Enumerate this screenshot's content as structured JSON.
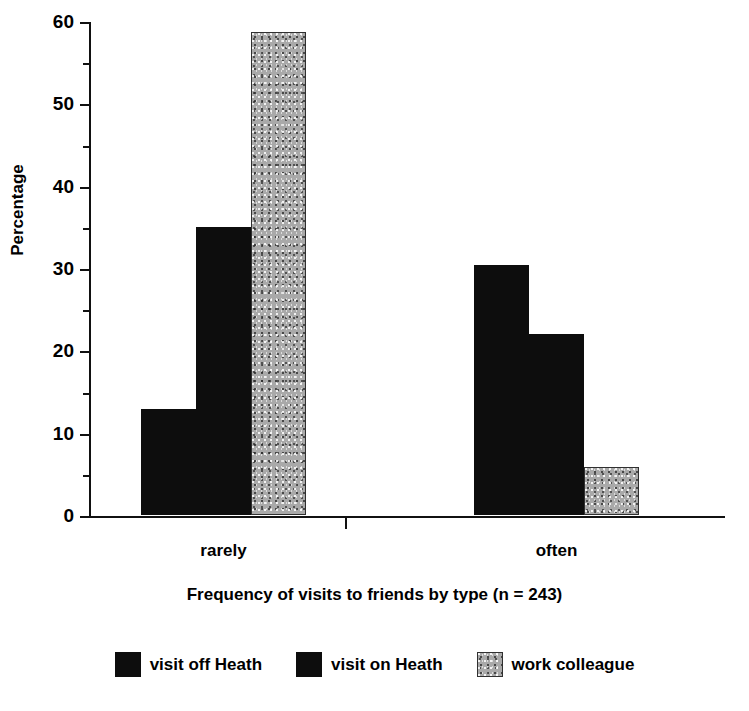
{
  "chart_data": {
    "type": "bar",
    "title": "",
    "subtitle": "",
    "caption": "Frequency of visits to friends by type (n = 243)",
    "xlabel": "",
    "ylabel": "Percentage",
    "categories": [
      "rarely",
      "often"
    ],
    "series": [
      {
        "name": "visit off Heath",
        "values": [
          12.9,
          30.4
        ],
        "color": "#0d0d0d",
        "fill": "solid-black"
      },
      {
        "name": "visit on Heath",
        "values": [
          35.0,
          22.0
        ],
        "color": "#0d0d0d",
        "fill": "solid-black"
      },
      {
        "name": "work colleague",
        "values": [
          58.7,
          5.8
        ],
        "color": "#a9a9a9",
        "fill": "stippled-gray"
      }
    ],
    "ylim": [
      0,
      60
    ],
    "ytick_labels": [
      "0",
      "10",
      "20",
      "30",
      "40",
      "50",
      "60"
    ],
    "ytick_values": [
      0,
      10,
      20,
      30,
      40,
      50,
      60
    ],
    "yminor_tick_values": [
      5,
      15,
      25,
      35,
      45,
      55
    ],
    "grid": false,
    "legend_position": "bottom",
    "bars_adjacent": true
  },
  "axis": {
    "ylabel": "Percentage"
  },
  "legend": {
    "entries": [
      {
        "label": "visit off Heath",
        "swatch": "black"
      },
      {
        "label": "visit on Heath",
        "swatch": "black"
      },
      {
        "label": "work colleague",
        "swatch": "gray"
      }
    ]
  },
  "caption": "Frequency of visits to friends by type (n = 243)",
  "colors": {
    "black": "#0d0d0d",
    "gray": "#a9a9a9",
    "axis": "#111111",
    "background": "#ffffff"
  }
}
